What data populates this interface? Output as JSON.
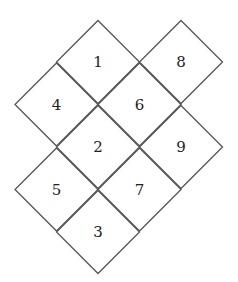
{
  "diagram": {
    "cells": [
      {
        "label": "1",
        "row": 0,
        "col": 0
      },
      {
        "label": "8",
        "row": 0,
        "col": 2
      },
      {
        "label": "4",
        "row": 1,
        "col": -1
      },
      {
        "label": "6",
        "row": 1,
        "col": 1
      },
      {
        "label": "2",
        "row": 2,
        "col": 0
      },
      {
        "label": "9",
        "row": 2,
        "col": 2
      },
      {
        "label": "5",
        "row": 3,
        "col": -1
      },
      {
        "label": "7",
        "row": 3,
        "col": 1
      },
      {
        "label": "3",
        "row": 4,
        "col": 0
      }
    ],
    "colors": {
      "stroke": "#555555",
      "text": "#222222",
      "background": "#ffffff"
    }
  }
}
